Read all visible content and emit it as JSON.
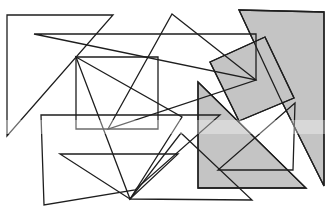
{
  "figure": {
    "colors": {
      "stroke": "#1e1e1e",
      "shade": "#c4c4c4",
      "background": "#ffffff"
    },
    "shapes": [
      {
        "id": "big-gray-quad",
        "fill": "shaded",
        "points": "239,10 324,12 324,186 280,98"
      },
      {
        "id": "gray-rect-lower",
        "fill": "shaded",
        "points": "198,82 306,188 198,188"
      },
      {
        "id": "gray-tilted-rect",
        "fill": "shaded",
        "points": "210,62 265,37 294,98 239,121"
      },
      {
        "id": "left-triangle",
        "fill": "outline",
        "points": "7,15 113,15 7,136"
      },
      {
        "id": "top-long-triangle",
        "fill": "outline",
        "points": "34,34 256,34 256,80"
      },
      {
        "id": "upper-triangle",
        "fill": "outline",
        "points": "172,14 256,80 108,129"
      },
      {
        "id": "center-rect",
        "fill": "outline",
        "points": "76,57 158,57 158,129 76,129"
      },
      {
        "id": "bottom-left-quad",
        "fill": "outline",
        "points": "41,115 220,115 135,190 44,205"
      },
      {
        "id": "bottom-triangle",
        "fill": "outline",
        "points": "60,154 178,154 130,199"
      },
      {
        "id": "long-diagonal-triangle",
        "fill": "outline",
        "points": "76,57 182,117 130,199"
      },
      {
        "id": "right-small-triangle",
        "fill": "outline",
        "points": "295,103 293,170 218,170"
      },
      {
        "id": "bottom-long-base",
        "fill": "outline",
        "points": "130,199 252,200 181,133"
      },
      {
        "id": "lower-gray-triangle-edge",
        "fill": "outline",
        "points": "198,82 306,188 198,188"
      },
      {
        "id": "big-gray-quad-edge",
        "fill": "outline",
        "points": "239,10 324,12 324,186 280,98"
      },
      {
        "id": "tilted-rect-edge",
        "fill": "outline",
        "points": "210,62 265,37 294,98 239,121"
      }
    ]
  }
}
